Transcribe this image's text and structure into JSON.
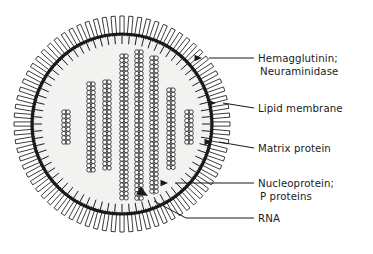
{
  "diagram": {
    "background_color": "#ffffff",
    "ink_color": "#1a1a1a",
    "interior_fill": "#f2f2f0",
    "labels": [
      {
        "id": "hemagglutinin",
        "line1": "Hemagglutinin;",
        "line2": "Neuraminidase",
        "target": "surface-spikes",
        "text_x": 258,
        "text_y": 62,
        "leader_from_x": 254,
        "leader_from_y": 58,
        "leader_to_x": 202,
        "leader_to_y": 58,
        "arrow": "left"
      },
      {
        "id": "lipid-membrane",
        "line1": "Lipid membrane",
        "line2": "",
        "target": "lipid-bilayer",
        "text_x": 258,
        "text_y": 112,
        "leader_from_x": 254,
        "leader_from_y": 108,
        "leader_to_x": 216,
        "leader_to_y": 103,
        "arrow": "left"
      },
      {
        "id": "matrix-protein",
        "line1": "Matrix protein",
        "line2": "",
        "target": "matrix-layer",
        "text_x": 258,
        "text_y": 152,
        "leader_from_x": 254,
        "leader_from_y": 148,
        "leader_to_x": 212,
        "leader_to_y": 142,
        "arrow": "left"
      },
      {
        "id": "nucleoprotein",
        "line1": "Nucleoprotein;",
        "line2": "P proteins",
        "target": "rnp-helices",
        "text_x": 258,
        "text_y": 187,
        "leader_from_x": 254,
        "leader_from_y": 183,
        "leader_to_x": 168,
        "leader_to_y": 183,
        "arrow": "left"
      },
      {
        "id": "rna",
        "line1": "RNA",
        "line2": "",
        "target": "rna-strand",
        "text_x": 258,
        "text_y": 222,
        "leader_from_x": 254,
        "leader_from_y": 218,
        "leader_to_x": 148,
        "leader_to_y": 196,
        "arrow": "upleft"
      }
    ],
    "virion": {
      "center_x": 122,
      "center_y": 124,
      "membrane_radius": 90,
      "membrane_stroke_width": 3.2,
      "spike_outer_radius": 108,
      "spike_inner_radius": 90,
      "spike_count": 76,
      "spike_width": 4.2,
      "matrix_tick_inner_radius": 80,
      "matrix_tick_outer_radius": 90,
      "matrix_tick_count": 76
    },
    "rnp_helices": [
      {
        "id": "helix-1",
        "x": 66,
        "top": 112,
        "bottom": 142
      },
      {
        "id": "helix-2",
        "x": 91,
        "top": 84,
        "bottom": 170
      },
      {
        "id": "helix-3",
        "x": 107,
        "top": 82,
        "bottom": 166
      },
      {
        "id": "helix-4",
        "x": 124,
        "top": 56,
        "bottom": 196
      },
      {
        "id": "helix-5",
        "x": 139,
        "top": 52,
        "bottom": 198
      },
      {
        "id": "helix-6",
        "x": 154,
        "top": 58,
        "bottom": 192
      },
      {
        "id": "helix-7",
        "x": 171,
        "top": 90,
        "bottom": 166
      },
      {
        "id": "helix-8",
        "x": 189,
        "top": 112,
        "bottom": 142
      }
    ],
    "rnp_bead": {
      "radius": 2.1,
      "column_offset": 2.2,
      "row_pitch": 4.3,
      "stroke_width": 0.8
    }
  }
}
